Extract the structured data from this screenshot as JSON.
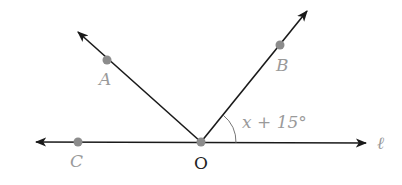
{
  "diagram": {
    "points": [
      {
        "name": "A",
        "label": "A",
        "x": 107,
        "y": 60
      },
      {
        "name": "B",
        "label": "B",
        "x": 280,
        "y": 45
      },
      {
        "name": "C",
        "label": "C",
        "x": 78,
        "y": 142
      },
      {
        "name": "O",
        "label": "O",
        "x": 201,
        "y": 142
      }
    ],
    "line_label": "ℓ",
    "angle_label": "x + 15°",
    "colors": {
      "line": "#1a1a1a",
      "point": "#8c8c8c",
      "label": "#9a9a9a"
    }
  }
}
